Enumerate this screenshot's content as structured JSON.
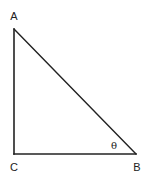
{
  "figure": {
    "type": "right-triangle",
    "stroke_color": "#222222",
    "background": "#ffffff",
    "vertices": {
      "A": {
        "label": "A",
        "x": 14,
        "y": 29,
        "label_x": 14,
        "label_y": 20
      },
      "B": {
        "label": "B",
        "x": 136,
        "y": 154,
        "label_x": 137,
        "label_y": 171
      },
      "C": {
        "label": "C",
        "x": 14,
        "y": 154,
        "label_x": 14,
        "label_y": 171
      }
    },
    "right_angle_at": "C",
    "angle_marker": {
      "label": "θ",
      "at_vertex": "B",
      "x": 114,
      "y": 149
    },
    "sides": [
      {
        "name": "AC",
        "from": "A",
        "to": "C"
      },
      {
        "name": "CB",
        "from": "C",
        "to": "B"
      },
      {
        "name": "AB",
        "from": "A",
        "to": "B"
      }
    ]
  }
}
